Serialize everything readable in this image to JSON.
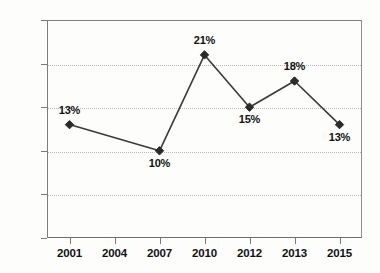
{
  "chart_data": {
    "type": "line",
    "title": "",
    "subtitle": "",
    "xlabel": "",
    "ylabel": "",
    "categories": [
      "2001",
      "2004",
      "2007",
      "2010",
      "2012",
      "2013",
      "2015"
    ],
    "series": [
      {
        "name": "",
        "values": [
          13,
          null,
          10,
          21,
          15,
          18,
          13
        ],
        "point_labels": [
          "13%",
          "",
          "10%",
          "21%",
          "15%",
          "18%",
          "13%"
        ]
      }
    ],
    "ylim": [
      0,
      25
    ],
    "ytick_values": [
      0,
      5,
      10,
      15,
      20,
      25
    ],
    "ytick_labels": [
      "0%",
      "5%",
      "10%",
      "15%",
      "20%",
      "25%"
    ],
    "grid": "horizontal-dotted",
    "legend": "none",
    "marker": "diamond",
    "line_color": "#3a3a3a",
    "marker_color": "#2b2b2b",
    "grid_color": "#b9b9b9",
    "axis_color": "#7b7b7b",
    "text_color": "#111111",
    "background": "#ffffff",
    "note": "No data marker plotted at 2004; line segment spans 2001 to 2007 directly."
  }
}
